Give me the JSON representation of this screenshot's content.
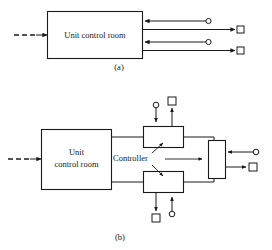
{
  "figure": {
    "stroke_color": "#1a1a1a",
    "background_color": "#ffffff",
    "panels": [
      {
        "id": "a",
        "caption": "(a)",
        "main_block_label": "Unit control room",
        "input": {
          "style": "dashed-arrow",
          "direction": "right"
        },
        "branches": [
          {
            "id": "upper",
            "signal_in_label": "",
            "terminator_circle": true,
            "terminator_square": true
          },
          {
            "id": "lower",
            "signal_in_label": "",
            "terminator_circle": true,
            "terminator_square": true
          }
        ]
      },
      {
        "id": "b",
        "caption": "(b)",
        "main_block_label_line1": "Unit",
        "main_block_label_line2": "control room",
        "controller_label": "Controller",
        "input": {
          "style": "dashed-arrow",
          "direction": "right"
        },
        "controllers": [
          {
            "id": "upper-controller",
            "position": "top",
            "input_marker": "circle",
            "output_marker": "square"
          },
          {
            "id": "lower-controller",
            "position": "bottom",
            "input_marker": "circle",
            "output_marker": "square"
          }
        ],
        "summing_block": {
          "id": "right-vertical-block",
          "input_marker": "circle",
          "output_marker": "square"
        }
      }
    ]
  }
}
